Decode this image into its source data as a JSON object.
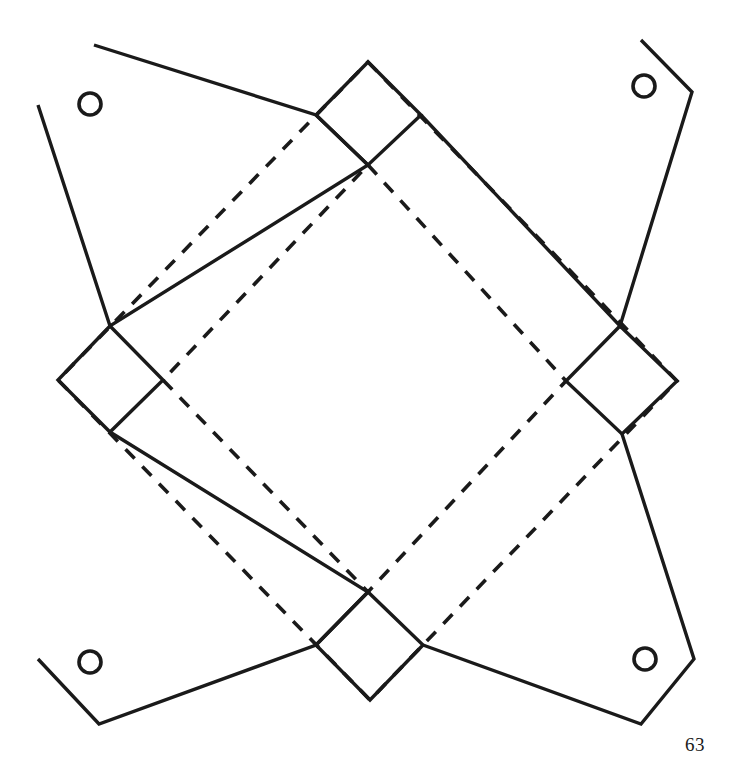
{
  "document": {
    "type": "papercraft-fold-pattern",
    "page_number": "63",
    "background_color": "#ffffff",
    "line_color": "#1a1a1a"
  },
  "diagram": {
    "title": "",
    "caption": "",
    "line_styles": {
      "cut": "solid",
      "fold": "dashed"
    },
    "holes": [
      {
        "name": "hole-top-left",
        "cx": 90,
        "cy": 104,
        "r": 11
      },
      {
        "name": "hole-top-right",
        "cx": 644,
        "cy": 86,
        "r": 11
      },
      {
        "name": "hole-bottom-left",
        "cx": 90,
        "cy": 662,
        "r": 11
      },
      {
        "name": "hole-bottom-right",
        "cx": 645,
        "cy": 659,
        "r": 11
      }
    ],
    "flaps": [
      {
        "name": "flap-top-left",
        "points": "94,45 316,115 368,165 110,326 38,105"
      },
      {
        "name": "flap-top-right",
        "points": "641,40 692,92 620,326 421,115"
      },
      {
        "name": "flap-bottom-left",
        "points": "110,432 368,592 316,645 99,724 38,659"
      },
      {
        "name": "flap-bottom-right",
        "points": "622,434 694,659 641,724 423,645"
      }
    ],
    "tabs": [
      {
        "name": "tab-north",
        "points": "316,115 368,62 421,115 368,165"
      },
      {
        "name": "tab-east",
        "points": "620,326 677,381 622,434 566,381"
      },
      {
        "name": "tab-south",
        "points": "316,645 368,592 423,645 370,700"
      },
      {
        "name": "tab-west",
        "points": "110,326 163,380 110,432 58,380"
      }
    ],
    "fold_diamonds": [
      {
        "name": "fold-diamond-outer",
        "points": "368,62 677,381 370,700 58,380"
      },
      {
        "name": "fold-diamond-inner",
        "points": "368,165 566,381 368,592 163,380"
      }
    ]
  }
}
